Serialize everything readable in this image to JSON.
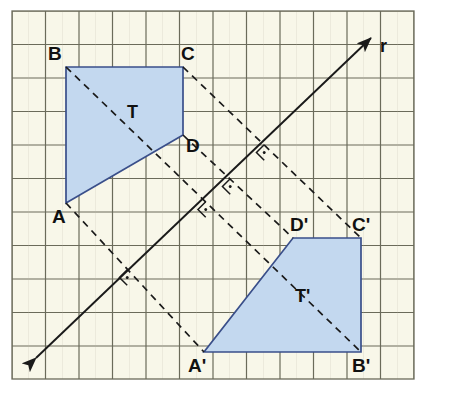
{
  "figure": {
    "credit": "Banco de imagens/Arquivo da editora",
    "background_color": "#f8f7e9",
    "grid_color": "#6b6b5a",
    "grid_minor_color": "#b9b8a6",
    "shape_fill": "#c3d8ef",
    "shape_stroke": "#3a4f8a",
    "construction_color": "#1a1a1a",
    "grid": {
      "origin_x": 12,
      "origin_y": 11,
      "cell": 33.5,
      "cols": 12,
      "rows": 11
    }
  },
  "mirror_line": {
    "label": "r",
    "label_x": 380,
    "label_y": 52,
    "x1": 36,
    "y1": 358,
    "x2": 371,
    "y2": 38,
    "arrow_start": true,
    "arrow_end": true
  },
  "shapes": [
    {
      "name": "T",
      "label": "T",
      "label_x": 127,
      "label_y": 118,
      "points": "66,67 183,67 183,135 66,203",
      "vertices": [
        {
          "label": "B",
          "x": 66,
          "y": 67,
          "label_x": 48,
          "label_y": 60
        },
        {
          "label": "C",
          "x": 183,
          "y": 67,
          "label_x": 181,
          "label_y": 60
        },
        {
          "label": "D",
          "x": 183,
          "y": 135,
          "label_x": 186,
          "label_y": 152
        },
        {
          "label": "A",
          "x": 66,
          "y": 203,
          "label_x": 52,
          "label_y": 223
        }
      ]
    },
    {
      "name": "T-prime",
      "label": "T'",
      "label_x": 295,
      "label_y": 302,
      "points": "293,238 361,238 361,352 204,352",
      "vertices": [
        {
          "label": "D'",
          "x": 293,
          "y": 238,
          "label_x": 290,
          "label_y": 231
        },
        {
          "label": "C'",
          "x": 361,
          "y": 238,
          "label_x": 352,
          "label_y": 231
        },
        {
          "label": "B'",
          "x": 361,
          "y": 352,
          "label_x": 352,
          "label_y": 372
        },
        {
          "label": "A'",
          "x": 204,
          "y": 352,
          "label_x": 188,
          "label_y": 372
        }
      ]
    }
  ],
  "construction_lines": [
    {
      "name": "segment-B-B-prime",
      "x1": 66,
      "y1": 67,
      "x2": 361,
      "y2": 352,
      "midpoint_x": 213.5,
      "midpoint_y": 209.5
    },
    {
      "name": "segment-C-C-prime",
      "x1": 183,
      "y1": 67,
      "x2": 361,
      "y2": 238,
      "midpoint_x": 272,
      "midpoint_y": 152.5
    },
    {
      "name": "segment-D-D-prime",
      "x1": 183,
      "y1": 135,
      "x2": 293,
      "y2": 238,
      "midpoint_x": 238,
      "midpoint_y": 186.5
    },
    {
      "name": "segment-A-A-prime",
      "x1": 66,
      "y1": 203,
      "x2": 204,
      "y2": 352,
      "midpoint_x": 135,
      "midpoint_y": 277.5
    }
  ],
  "right_angle_marks": [
    {
      "name": "right-angle-mark-aa",
      "x": 135,
      "y": 277.5
    },
    {
      "name": "right-angle-mark-bb",
      "x": 213.5,
      "y": 209.5
    },
    {
      "name": "right-angle-mark-dd",
      "x": 238,
      "y": 186.5
    },
    {
      "name": "right-angle-mark-cc",
      "x": 272,
      "y": 152.5
    }
  ]
}
